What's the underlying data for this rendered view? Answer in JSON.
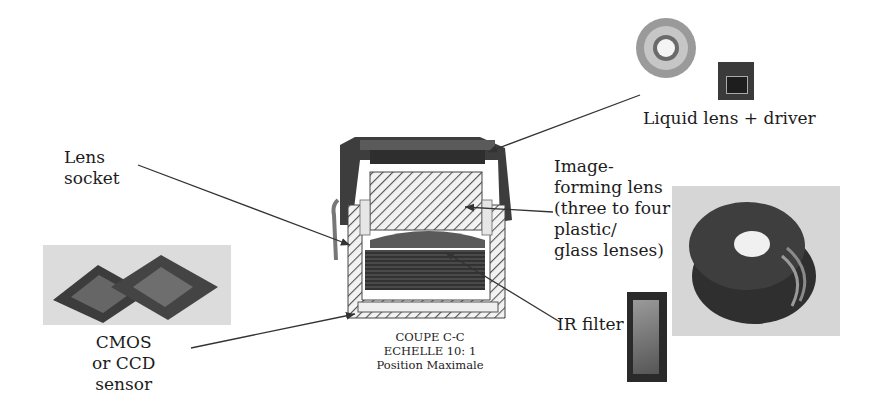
{
  "labels": {
    "lens_socket": "Lens\nsocket",
    "liquid_lens": "Liquid lens + driver",
    "image_forming_lens": "Image-\nforming lens\n(three to four\nplastic/\nglass lenses)",
    "ir_filter": "IR filter",
    "sensor": "CMOS\nor CCD\nsensor"
  },
  "caption": {
    "line1": "COUPE C-C",
    "line2": "ECHELLE 10: 1",
    "line3": "Position Maximale"
  },
  "colors": {
    "text": "#1c1c1c",
    "arrow": "#333333",
    "housing_dark": "#3a3a3a",
    "hatch": "#555555",
    "photo_bg": "#d9d9d9"
  }
}
